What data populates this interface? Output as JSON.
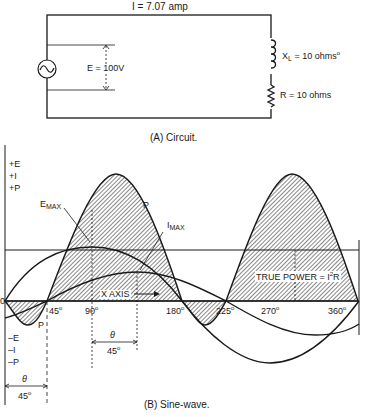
{
  "circuit": {
    "current_label": "I = 7.07 amp",
    "voltage_label": "E = 100V",
    "inductor_label_main": "X",
    "inductor_label_sub": "L",
    "inductor_value": " = 10 ohms",
    "resistor_label": "R = 10 ohms",
    "caption": "(A)  Circuit."
  },
  "waveform": {
    "positive_labels": [
      "+E",
      "+I",
      "+P"
    ],
    "negative_labels": [
      "–E",
      "–I",
      "–P"
    ],
    "emax_main": "E",
    "emax_sub": "MAX",
    "imax_main": "I",
    "imax_sub": "MAX",
    "p_label_top": "P",
    "p_label_bottom": "P",
    "x_axis_label": "X AXIS",
    "true_power_label": "TRUE POWER = I",
    "true_power_sup": "2",
    "true_power_tail": "R",
    "origin_label": "0",
    "degree_ticks": [
      "45",
      "90",
      "180",
      "225",
      "270",
      "360"
    ],
    "theta_symbol": "θ",
    "theta_value": "45",
    "caption": "(B)  Sine-wave."
  },
  "chart_data": {
    "type": "line",
    "title": "Sine-wave",
    "xlabel": "X AXIS (degrees)",
    "ylabel": "E, I, P",
    "x": [
      0,
      45,
      90,
      135,
      180,
      225,
      270,
      315,
      360
    ],
    "series": [
      {
        "name": "E",
        "values": [
          0,
          0.707,
          1,
          0.707,
          0,
          -0.707,
          -1,
          -0.707,
          0
        ]
      },
      {
        "name": "I",
        "values": [
          -0.707,
          0,
          0.707,
          1,
          0.707,
          0,
          -0.707,
          -1,
          -0.707
        ]
      },
      {
        "name": "P",
        "values": [
          0,
          0,
          0.707,
          0.707,
          0,
          0,
          0.707,
          0.707,
          0
        ]
      }
    ],
    "annotations": [
      "E MAX",
      "I MAX",
      "P",
      "TRUE POWER = I^2 R",
      "theta = 45 deg phase shift"
    ],
    "xlim": [
      0,
      360
    ]
  }
}
